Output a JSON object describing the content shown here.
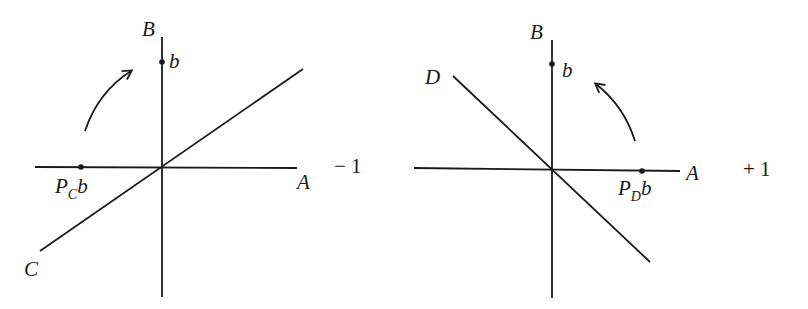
{
  "figure": {
    "stroke_color": "#1a1a1a",
    "background": "#ffffff"
  },
  "left_diagram": {
    "axis_vertical_label": "B",
    "axis_horizontal_label": "A",
    "line_label": "C",
    "point_label": "b",
    "projection_label_main": "P",
    "projection_label_sub": "C",
    "projection_label_tail": "b",
    "eigen_sign": "− 1",
    "arrow_direction": "clockwise-up"
  },
  "right_diagram": {
    "axis_vertical_label": "B",
    "axis_horizontal_label": "A",
    "line_label": "D",
    "point_label": "b",
    "projection_label_main": "P",
    "projection_label_sub": "D",
    "projection_label_tail": "b",
    "eigen_sign": "+ 1",
    "arrow_direction": "counterclockwise-up"
  }
}
